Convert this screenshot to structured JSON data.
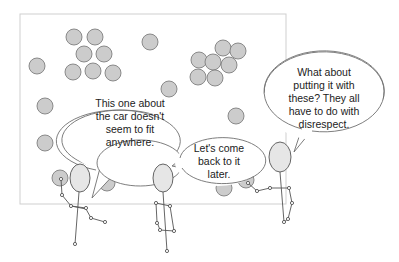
{
  "scene": {
    "board": {
      "x": 20,
      "y": 14,
      "width": 266,
      "height": 190,
      "stroke": "#cfcfcf",
      "fill": "#ffffff"
    },
    "cards": [
      {
        "cx": 74,
        "cy": 37
      },
      {
        "cx": 95,
        "cy": 37
      },
      {
        "cx": 84,
        "cy": 54
      },
      {
        "cx": 104,
        "cy": 54
      },
      {
        "cx": 73,
        "cy": 72
      },
      {
        "cx": 93,
        "cy": 71
      },
      {
        "cx": 113,
        "cy": 73
      },
      {
        "cx": 37,
        "cy": 66
      },
      {
        "cx": 150,
        "cy": 42
      },
      {
        "cx": 223,
        "cy": 48
      },
      {
        "cx": 238,
        "cy": 51
      },
      {
        "cx": 199,
        "cy": 60
      },
      {
        "cx": 213,
        "cy": 62
      },
      {
        "cx": 229,
        "cy": 65
      },
      {
        "cx": 198,
        "cy": 77
      },
      {
        "cx": 215,
        "cy": 78
      },
      {
        "cx": 169,
        "cy": 89
      },
      {
        "cx": 45,
        "cy": 106
      },
      {
        "cx": 236,
        "cy": 116
      },
      {
        "cx": 45,
        "cy": 143
      },
      {
        "cx": 119,
        "cy": 155
      },
      {
        "cx": 60,
        "cy": 178
      },
      {
        "cx": 107,
        "cy": 183
      },
      {
        "cx": 224,
        "cy": 188
      },
      {
        "cx": 246,
        "cy": 180
      }
    ],
    "card_fill": "#cccccc",
    "card_stroke": "#7f7f7f"
  },
  "bubbles": [
    {
      "id": "left",
      "text_lines": [
        "This one about",
        "the car doesn't",
        "seem to fit",
        "anywhere."
      ]
    },
    {
      "id": "middle",
      "text_lines": [
        "Let's come",
        "back to it",
        "later."
      ]
    },
    {
      "id": "right",
      "text_lines": [
        "What about",
        "putting it with",
        "these? They all",
        "have to do with",
        "disrespect."
      ]
    }
  ]
}
